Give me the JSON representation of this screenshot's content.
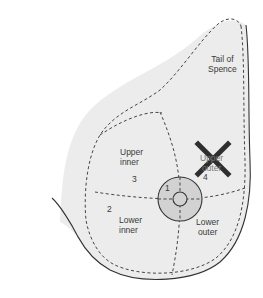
{
  "diagram": {
    "type": "anatomical-diagram",
    "labels": {
      "tail": "Tail of Spence",
      "tail_line1": "Tail of",
      "tail_line2": "Spence",
      "upper_inner_line1": "Upper",
      "upper_inner_line2": "inner",
      "upper_outer_line1": "Upper",
      "upper_outer_line2": "outer",
      "lower_inner_line1": "Lower",
      "lower_inner_line2": "inner",
      "lower_outer_line1": "Lower",
      "lower_outer_line2": "outer"
    },
    "numbers": {
      "areola": "1",
      "lower_inner": "2",
      "upper_inner": "3",
      "upper_outer": "4"
    },
    "marker": {
      "symbol": "X",
      "location": "upper outer quadrant",
      "color": "#2e2e2e"
    },
    "colors": {
      "breast_fill": "#ebebeb",
      "areola_fill": "#cfcfcf",
      "outline": "#333333",
      "dashed": "#444444"
    }
  }
}
